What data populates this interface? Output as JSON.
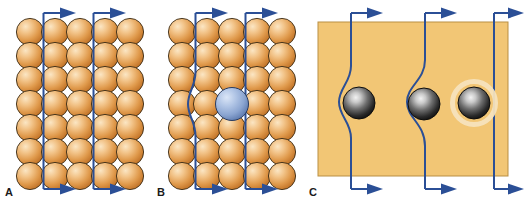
{
  "figure": {
    "type": "diagram",
    "background_color": "#ffffff"
  },
  "colors": {
    "atom_orange_light": "#f7d9a8",
    "atom_orange_mid": "#e8a355",
    "atom_orange_dark": "#c97d2e",
    "atom_outline": "#3a2a14",
    "impurity_blue_light": "#cfdcf0",
    "impurity_blue_mid": "#8fa8d4",
    "impurity_blue_dark": "#5a78ad",
    "impurity_outline": "#2b3c5e",
    "block_orange": "#f2c675",
    "block_outline": "#b98f45",
    "particle_light": "#e8e8e8",
    "particle_mid": "#6a6a6a",
    "particle_dark": "#171717",
    "particle_outline": "#0d0d0d",
    "particle_halo": "#f6e3bd",
    "flux_line_blue": "#2b4f96",
    "label_color": "#1a1a1a"
  },
  "panels": [
    {
      "id": "A",
      "label": "A",
      "caption_letter": "A",
      "description": "Perfect crystal lattice of identical atoms with undistorted straight magnetic flux lines",
      "lattice": {
        "columns": 5,
        "rows": 7,
        "atom_type": "host-atom",
        "atom_color": "orange",
        "impurities": 0
      },
      "flux_lines": [
        {
          "id": "flux-line-1",
          "shape": "straight",
          "bent": false,
          "arrow_top": "right",
          "arrow_bottom": "right"
        },
        {
          "id": "flux-line-2",
          "shape": "straight",
          "bent": false,
          "arrow_top": "right",
          "arrow_bottom": "right"
        }
      ]
    },
    {
      "id": "B",
      "label": "B",
      "caption_letter": "B",
      "description": "Lattice containing one oversized impurity atom that pins and bends a flux line",
      "lattice": {
        "columns": 5,
        "rows": 7,
        "atom_type": "host-atom",
        "atom_color": "orange",
        "impurities": 1,
        "impurity": {
          "color": "blue",
          "row": 4,
          "column": 3,
          "relative_size": "larger",
          "name": "impurity-atom"
        }
      },
      "flux_lines": [
        {
          "id": "flux-line-1",
          "shape": "bent",
          "bent": true,
          "bend_direction": "left",
          "arrow_top": "right",
          "arrow_bottom": "right"
        },
        {
          "id": "flux-line-2",
          "shape": "straight",
          "bent": false,
          "arrow_top": "right",
          "arrow_bottom": "right"
        }
      ]
    },
    {
      "id": "C",
      "label": "C",
      "caption_letter": "C",
      "description": "Bulk superconductor block with embedded pinning particles deflecting flux lines",
      "block": {
        "shape": "rectangle",
        "color": "block_orange"
      },
      "particles": [
        {
          "id": "particle-1",
          "name": "pinning-particle",
          "halo": false,
          "pinned_flux_line": "flux-line-1"
        },
        {
          "id": "particle-2",
          "name": "pinning-particle",
          "halo": false,
          "pinned_flux_line": "flux-line-2"
        },
        {
          "id": "particle-3",
          "name": "pinning-particle",
          "halo": true,
          "pinned_flux_line": null
        }
      ],
      "flux_lines": [
        {
          "id": "flux-line-1",
          "shape": "bent",
          "bent": true,
          "bend_direction": "left",
          "arrow_top": "right",
          "arrow_bottom": "right"
        },
        {
          "id": "flux-line-2",
          "shape": "bent",
          "bent": true,
          "bend_direction": "left",
          "arrow_top": "right",
          "arrow_bottom": "right"
        },
        {
          "id": "flux-line-3",
          "shape": "straight",
          "bent": false,
          "arrow_top": "right",
          "arrow_bottom": "right"
        }
      ]
    }
  ]
}
